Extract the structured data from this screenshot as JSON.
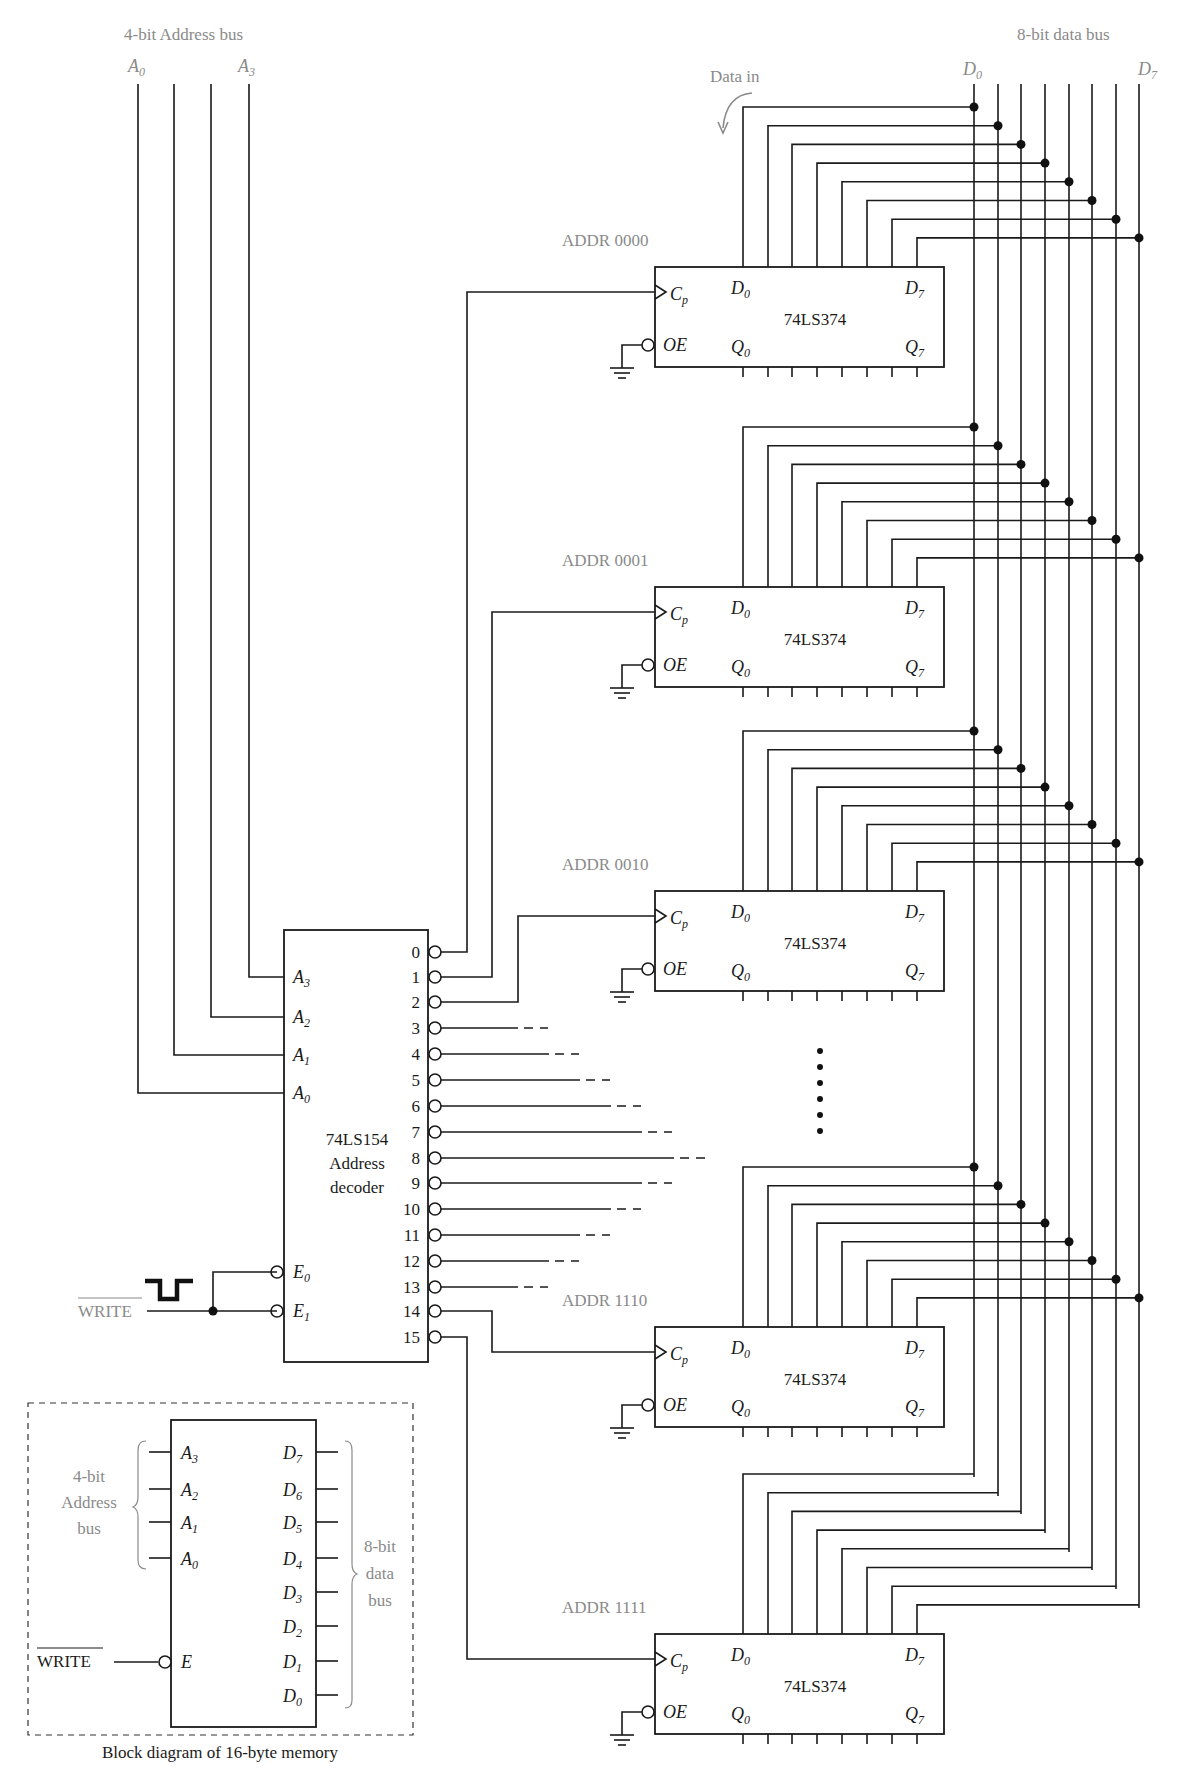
{
  "labels": {
    "address_bus_title": "4-bit Address bus",
    "data_bus_title": "8-bit data bus",
    "address_bus_first": "A",
    "address_bus_first_sub": "0",
    "address_bus_last": "A",
    "address_bus_last_sub": "3",
    "data_bus_first": "D",
    "data_bus_first_sub": "0",
    "data_bus_last": "D",
    "data_bus_last_sub": "7",
    "data_in": "Data in",
    "write_signal": "WRITE"
  },
  "address_bus": {
    "lines_x": [
      138,
      174,
      211,
      249
    ],
    "top_y": 84
  },
  "data_bus": {
    "lines_x": [
      974,
      998,
      1021,
      1045,
      1069,
      1092,
      1116,
      1139
    ],
    "top_y": 84,
    "bottom_y_by_bit": [
      1477,
      1496,
      1514,
      1533,
      1552,
      1570,
      1589,
      1608
    ]
  },
  "decoder": {
    "name": "74LS154",
    "subtitle_1": "Address",
    "subtitle_2": "decoder",
    "box": {
      "x": 284,
      "y": 930,
      "w": 144,
      "h": 432
    },
    "inputs": [
      {
        "label": "A",
        "sub": "3",
        "y": 977,
        "bus_x": 249
      },
      {
        "label": "A",
        "sub": "2",
        "y": 1017,
        "bus_x": 211
      },
      {
        "label": "A",
        "sub": "1",
        "y": 1055,
        "bus_x": 174
      },
      {
        "label": "A",
        "sub": "0",
        "y": 1093,
        "bus_x": 138
      }
    ],
    "enables": [
      {
        "label": "E",
        "sub": "0",
        "y": 1272
      },
      {
        "label": "E",
        "sub": "1",
        "y": 1311
      }
    ],
    "outputs": [
      {
        "n": "0",
        "y": 952
      },
      {
        "n": "1",
        "y": 977
      },
      {
        "n": "2",
        "y": 1002
      },
      {
        "n": "3",
        "y": 1028,
        "solid_to": 518,
        "dash_to": 548
      },
      {
        "n": "4",
        "y": 1054,
        "solid_to": 549,
        "dash_to": 579
      },
      {
        "n": "5",
        "y": 1080,
        "solid_to": 580,
        "dash_to": 610
      },
      {
        "n": "6",
        "y": 1106,
        "solid_to": 611,
        "dash_to": 641
      },
      {
        "n": "7",
        "y": 1132,
        "solid_to": 642,
        "dash_to": 672
      },
      {
        "n": "8",
        "y": 1158,
        "solid_to": 674,
        "dash_to": 705
      },
      {
        "n": "9",
        "y": 1183,
        "solid_to": 642,
        "dash_to": 672
      },
      {
        "n": "10",
        "y": 1209,
        "solid_to": 611,
        "dash_to": 641
      },
      {
        "n": "11",
        "y": 1235,
        "solid_to": 580,
        "dash_to": 610
      },
      {
        "n": "12",
        "y": 1261,
        "solid_to": 549,
        "dash_to": 579
      },
      {
        "n": "13",
        "y": 1287,
        "solid_to": 518,
        "dash_to": 548
      },
      {
        "n": "14",
        "y": 1311
      },
      {
        "n": "15",
        "y": 1337
      }
    ]
  },
  "registers": [
    {
      "addr_label": "ADDR 0000",
      "chip": "74LS374",
      "top": 267,
      "decoder_output": 0,
      "route_x": 467,
      "has_bus_dots": true
    },
    {
      "addr_label": "ADDR 0001",
      "chip": "74LS374",
      "top": 587,
      "decoder_output": 1,
      "route_x": 492,
      "has_bus_dots": true
    },
    {
      "addr_label": "ADDR 0010",
      "chip": "74LS374",
      "top": 891,
      "decoder_output": 2,
      "route_x": 518,
      "has_bus_dots": true
    },
    {
      "addr_label": "ADDR 1110",
      "chip": "74LS374",
      "top": 1327,
      "decoder_output": 14,
      "route_x": 492,
      "has_bus_dots": true
    },
    {
      "addr_label": "ADDR 1111",
      "chip": "74LS374",
      "top": 1634,
      "decoder_output": 15,
      "route_x": 467,
      "has_bus_dots": false
    }
  ],
  "register_pins": {
    "cp_label": "C",
    "cp_sub": "p",
    "oe_label": "OE",
    "d_first": "D",
    "d_first_sub": "0",
    "d_last": "D",
    "d_last_sub": "7",
    "q_first": "Q",
    "q_first_sub": "0",
    "q_last": "Q",
    "q_last_sub": "7",
    "pin_x": [
      743,
      768,
      792,
      817,
      842,
      867,
      892,
      917
    ]
  },
  "ellipsis_dots_y": [
    1051,
    1067,
    1083,
    1099,
    1115,
    1131
  ],
  "block_diagram": {
    "caption": "Block diagram of 16-byte memory",
    "address_group_label": [
      "4-bit",
      "Address",
      "bus"
    ],
    "data_group_label": [
      "8-bit",
      "data",
      "bus"
    ],
    "enable_label": "E",
    "write_label": "WRITE",
    "address_pins": [
      {
        "label": "A",
        "sub": "3",
        "y": 1452
      },
      {
        "label": "A",
        "sub": "2",
        "y": 1489
      },
      {
        "label": "A",
        "sub": "1",
        "y": 1522
      },
      {
        "label": "A",
        "sub": "0",
        "y": 1558
      }
    ],
    "data_pins": [
      {
        "label": "D",
        "sub": "7",
        "y": 1452
      },
      {
        "label": "D",
        "sub": "6",
        "y": 1489
      },
      {
        "label": "D",
        "sub": "5",
        "y": 1522
      },
      {
        "label": "D",
        "sub": "4",
        "y": 1558
      },
      {
        "label": "D",
        "sub": "3",
        "y": 1592
      },
      {
        "label": "D",
        "sub": "2",
        "y": 1626
      },
      {
        "label": "D",
        "sub": "1",
        "y": 1661
      },
      {
        "label": "D",
        "sub": "0",
        "y": 1695
      }
    ]
  },
  "colors": {
    "ink": "#1a1a1a",
    "annotation_gray": "#8a8a8a",
    "background": "#ffffff"
  }
}
